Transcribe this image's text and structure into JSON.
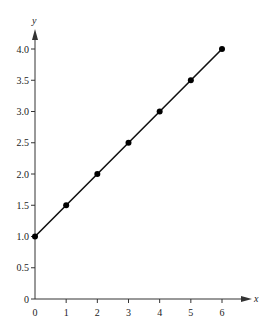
{
  "chart_data": {
    "type": "line",
    "title": "",
    "xlabel": "x",
    "ylabel": "y",
    "xlim": [
      0,
      6
    ],
    "ylim": [
      0,
      4.0
    ],
    "grid": false,
    "legend": null,
    "x_ticks": [
      "0",
      "1",
      "2",
      "3",
      "4",
      "5",
      "6"
    ],
    "y_ticks": [
      "0",
      "0.5",
      "1.0",
      "1.5",
      "2.0",
      "2.5",
      "3.0",
      "3.5",
      "4.0"
    ],
    "series": [
      {
        "name": "y = 0.5x + 1",
        "x": [
          0,
          1,
          2,
          3,
          4,
          5,
          6
        ],
        "values": [
          1.0,
          1.5,
          2.0,
          2.5,
          3.0,
          3.5,
          4.0
        ],
        "markers": true
      }
    ]
  },
  "style": {
    "axis_color": "#333333",
    "line_color": "#111111",
    "marker_color": "#000000",
    "text_color": "#222222"
  }
}
